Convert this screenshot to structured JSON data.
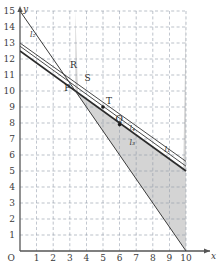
{
  "chart_data": {
    "type": "line",
    "title": "",
    "xlabel": "x",
    "ylabel": "y",
    "origin_label": "O",
    "xlim": [
      0,
      10
    ],
    "ylim": [
      0,
      15
    ],
    "xticks": [
      1,
      2,
      3,
      4,
      5,
      6,
      7,
      8,
      9,
      10
    ],
    "yticks": [
      1,
      2,
      3,
      4,
      5,
      6,
      7,
      8,
      9,
      10,
      11,
      12,
      13,
      14,
      15
    ],
    "grid": "dashed",
    "grid_color": "#8f9aa8",
    "shaded_region": {
      "label": "feasible-region",
      "fill": "#d4d4d4",
      "description": "region above the constraint lines, bounded below by l1 and on the left by l2"
    },
    "lines": [
      {
        "name": "l1",
        "x0": 0,
        "y0": 12.5,
        "x1": 10,
        "y1": 5.0,
        "label": "l₁",
        "label_x": 8.7,
        "label_y": 6.2,
        "color": "#2b2b2b",
        "width": 1.7
      },
      {
        "name": "l2",
        "x0": 0,
        "y0": 15.0,
        "x1": 10,
        "y1": 0.0,
        "label": "l₂",
        "label_x": 0.6,
        "label_y": 13.4,
        "color": "#3a3a3a",
        "width": 1.0
      },
      {
        "name": "l3",
        "x0": 0,
        "y0": 12.8,
        "x1": 10,
        "y1": 5.3,
        "label": "l₃",
        "label_x": 6.6,
        "label_y": 6.6,
        "color": "#4a4a4a",
        "width": 1.0
      },
      {
        "name": "l4",
        "x0": 0,
        "y0": 13.0,
        "x1": 10,
        "y1": 5.6,
        "label": "l₄",
        "label_x": 6.6,
        "label_y": 7.5,
        "color": "#4a4a4a",
        "width": 1.0
      }
    ],
    "points": [
      {
        "name": "P",
        "label": "P",
        "x": 3.15,
        "y": 10.15,
        "label_dx": -8,
        "label_dy": 2,
        "marker": false
      },
      {
        "name": "Q",
        "label": "Q",
        "x": 6.0,
        "y": 7.9,
        "label_dx": -4,
        "label_dy": -3,
        "marker": true
      },
      {
        "name": "R",
        "label": "R",
        "x": 3.2,
        "y": 11.3,
        "label_dx": -3,
        "label_dy": -2,
        "marker": false
      },
      {
        "name": "S",
        "label": "S",
        "x": 4.0,
        "y": 10.5,
        "label_dx": -2,
        "label_dy": -2,
        "marker": false
      },
      {
        "name": "T",
        "label": "T",
        "x": 5.0,
        "y": 9.0,
        "label_dx": 3,
        "label_dy": -3,
        "marker": true
      }
    ]
  },
  "axes": {
    "x_axis_name": "x",
    "y_axis_name": "y",
    "origin": "O"
  }
}
